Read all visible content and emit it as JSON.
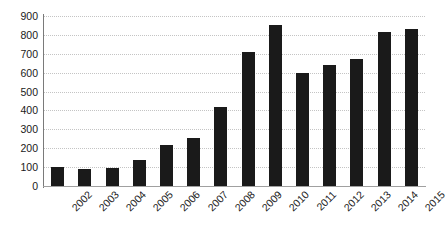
{
  "chart_data": {
    "type": "bar",
    "title": "",
    "subtitle": "",
    "xlabel": "",
    "ylabel": "",
    "categories": [
      "2002",
      "2003",
      "2004",
      "2005",
      "2006",
      "2007",
      "2008",
      "2009",
      "2010",
      "2011",
      "2012",
      "2013",
      "2014",
      "2015"
    ],
    "values": [
      100,
      90,
      95,
      140,
      215,
      255,
      420,
      710,
      855,
      600,
      640,
      670,
      815,
      830
    ],
    "series": [
      {
        "name": "",
        "values": [
          100,
          90,
          95,
          140,
          215,
          255,
          420,
          710,
          855,
          600,
          640,
          670,
          815,
          830
        ]
      }
    ],
    "ylim": [
      0,
      900
    ],
    "yticks": [
      0,
      100,
      200,
      300,
      400,
      500,
      600,
      700,
      800,
      900
    ],
    "ytick_labels": [
      "0",
      "100",
      "200",
      "300",
      "400",
      "500",
      "600",
      "700",
      "800",
      "900"
    ],
    "xtick_labels": [
      "2002",
      "2003",
      "2004",
      "2005",
      "2006",
      "2007",
      "2008",
      "2009",
      "2010",
      "2011",
      "2012",
      "2013",
      "2014",
      "2015"
    ],
    "xtick_rotation": -45,
    "grid": true,
    "grid_axis": "y",
    "grid_style": "dotted",
    "legend": false,
    "legend_position": "none",
    "bar_color": "#1a1a1a",
    "grid_color": "#c4c4c4",
    "axis_color": "#7a7a7a",
    "background_color": "#ffffff",
    "annotations": []
  }
}
